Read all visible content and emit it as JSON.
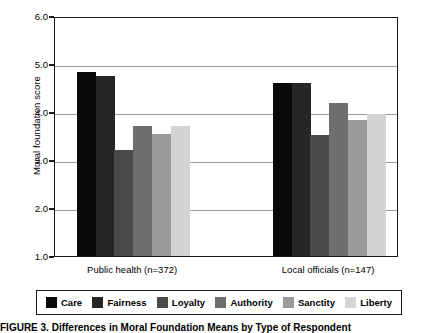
{
  "figure": {
    "caption": "FIGURE 3. Differences in Moral Foundation Means by Type of Respondent"
  },
  "chart_data": {
    "type": "bar",
    "title": "",
    "xlabel": "",
    "ylabel": "Moral foundation score",
    "ylim": [
      1.0,
      6.0
    ],
    "yticks": [
      "1.0",
      "2.0",
      "3.0",
      "4.0",
      "5.0",
      "6.0"
    ],
    "grid": true,
    "legend_position": "bottom",
    "categories": [
      "Public health (n=372)",
      "Local officials (n=147)"
    ],
    "series": [
      {
        "name": "Care",
        "color": "#0a0a0a",
        "values": [
          4.88,
          4.65
        ]
      },
      {
        "name": "Fairness",
        "color": "#262626",
        "values": [
          4.79,
          4.65
        ]
      },
      {
        "name": "Loyalty",
        "color": "#4a4a4a",
        "values": [
          3.24,
          3.57
        ]
      },
      {
        "name": "Authority",
        "color": "#6e6e6e",
        "values": [
          3.74,
          4.22
        ]
      },
      {
        "name": "Sanctity",
        "color": "#9a9a9a",
        "values": [
          3.59,
          3.88
        ]
      },
      {
        "name": "Liberty",
        "color": "#d4d4d4",
        "values": [
          3.74,
          4.01
        ]
      }
    ]
  }
}
